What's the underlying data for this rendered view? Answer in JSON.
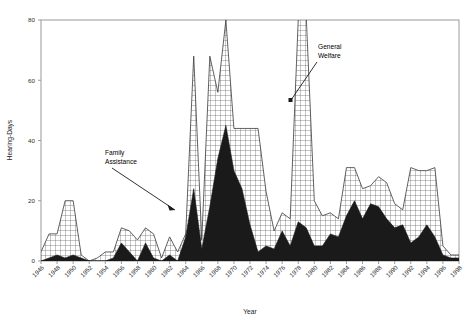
{
  "figure": {
    "cropped_title_fragment": "",
    "background_color": "#ffffff"
  },
  "axes": {
    "x_title": "Year",
    "y_title": "Hearing-Days",
    "y_ticks": [
      "0",
      "20",
      "40",
      "60",
      "80"
    ],
    "x_ticks": [
      "1946",
      "1948",
      "1950",
      "1952",
      "1954",
      "1956",
      "1958",
      "1960",
      "1962",
      "1964",
      "1966",
      "1968",
      "1970",
      "1972",
      "1974",
      "1976",
      "1978",
      "1980",
      "1982",
      "1984",
      "1986",
      "1988",
      "1990",
      "1992",
      "1994",
      "1996",
      "1998"
    ]
  },
  "annotations": [
    {
      "id": "family-assistance",
      "line1": "Family",
      "line2": "Assistance"
    },
    {
      "id": "general-welfare",
      "line1": "General",
      "line2": "Welfare"
    }
  ],
  "colors": {
    "family_assistance_fill": "#1a1a1a",
    "general_welfare_fill": "#ffffff",
    "general_welfare_hatch": "#555555",
    "axis": "#9a9a9a",
    "text": "#111111"
  },
  "chart_data": {
    "type": "area",
    "stacked": true,
    "title": "",
    "xlabel": "Year",
    "ylabel": "Hearing-Days",
    "xlim": [
      1946,
      1998
    ],
    "ylim": [
      0,
      80
    ],
    "grid": false,
    "legend": "annotated-inline",
    "x": [
      1946,
      1947,
      1948,
      1949,
      1950,
      1951,
      1952,
      1953,
      1954,
      1955,
      1956,
      1957,
      1958,
      1959,
      1960,
      1961,
      1962,
      1963,
      1964,
      1965,
      1966,
      1967,
      1968,
      1969,
      1970,
      1971,
      1972,
      1973,
      1974,
      1975,
      1976,
      1977,
      1978,
      1979,
      1980,
      1981,
      1982,
      1983,
      1984,
      1985,
      1986,
      1987,
      1988,
      1989,
      1990,
      1991,
      1992,
      1993,
      1994,
      1995,
      1996,
      1997,
      1998
    ],
    "series": [
      {
        "name": "Family Assistance",
        "pattern": "solid-dark",
        "values": [
          0,
          1,
          2,
          1,
          2,
          1,
          0,
          0,
          0,
          1,
          6,
          3,
          0,
          6,
          1,
          0,
          2,
          0,
          8,
          24,
          4,
          18,
          34,
          45,
          30,
          24,
          12,
          3,
          5,
          4,
          10,
          5,
          13,
          11,
          5,
          5,
          9,
          8,
          15,
          20,
          14,
          19,
          18,
          14,
          11,
          12,
          6,
          8,
          12,
          8,
          2,
          1,
          1
        ]
      },
      {
        "name": "General Welfare",
        "pattern": "crosshatch",
        "values": [
          3,
          8,
          7,
          19,
          18,
          1,
          0,
          1,
          3,
          2,
          5,
          7,
          7,
          5,
          8,
          1,
          6,
          3,
          1,
          44,
          3,
          50,
          22,
          35,
          14,
          20,
          32,
          41,
          18,
          6,
          6,
          9,
          67,
          70,
          15,
          10,
          7,
          6,
          16,
          11,
          10,
          6,
          10,
          12,
          8,
          5,
          25,
          22,
          18,
          23,
          3,
          1,
          1
        ]
      }
    ],
    "totals_note": "Values are stacked: plotted top boundary equals Family Assistance + General Welfare; peaks near 1969 (~80) and 1978-79 (~80+, clipped at axis top)."
  }
}
